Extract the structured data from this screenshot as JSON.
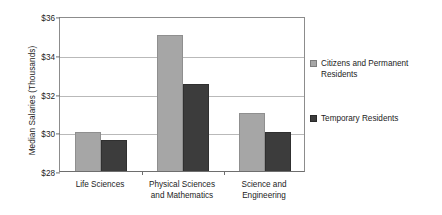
{
  "chart_data": {
    "type": "bar",
    "title": "",
    "xlabel": "",
    "ylabel": "Median Salaries (Thousands)",
    "ylim": [
      28,
      36
    ],
    "ytick_values": [
      36,
      34,
      32,
      30,
      28
    ],
    "ytick_labels": [
      "$36",
      "$34",
      "$32",
      "$30",
      "$28"
    ],
    "grid": true,
    "grid_axis": "y",
    "legend_position": "right",
    "categories": [
      "Life Sciences",
      "Physical Sciences and Mathematics",
      "Science and Engineering"
    ],
    "category_label_lines": [
      [
        "Life Sciences"
      ],
      [
        "Physical Sciences",
        "and Mathematics"
      ],
      [
        "Science and",
        "Engineering"
      ]
    ],
    "series": [
      {
        "name": "Citizens and Permanent Residents",
        "name_lines": [
          "Citizens and Permanent",
          "Residents"
        ],
        "color": "#a6a6a6",
        "values": [
          30.0,
          35.0,
          31.0
        ]
      },
      {
        "name": "Temporary Residents",
        "name_lines": [
          "Temporary Residents"
        ],
        "color": "#3c3c3c",
        "values": [
          29.6,
          32.5,
          30.0
        ]
      }
    ]
  },
  "axis": {
    "y_title": "Median Salaries (Thousands)",
    "ticks": [
      "$36",
      "$34",
      "$32",
      "$30",
      "$28"
    ]
  },
  "legend": {
    "items": [
      {
        "label": "Citizens and Permanent Residents",
        "line1": "Citizens and Permanent",
        "line2": "Residents",
        "color": "#a6a6a6"
      },
      {
        "label": "Temporary Residents",
        "line1": "Temporary Residents",
        "line2": "",
        "color": "#3c3c3c"
      }
    ]
  },
  "xlabels": [
    {
      "line1": "Life Sciences",
      "line2": ""
    },
    {
      "line1": "Physical Sciences",
      "line2": "and Mathematics"
    },
    {
      "line1": "Science and",
      "line2": "Engineering"
    }
  ],
  "colors": {
    "series_light": "#a6a6a6",
    "series_dark": "#3c3c3c",
    "gridline": "#b9b9b9",
    "frame": "#8c8c8c",
    "text": "#1c1c1c",
    "background": "#ffffff"
  }
}
